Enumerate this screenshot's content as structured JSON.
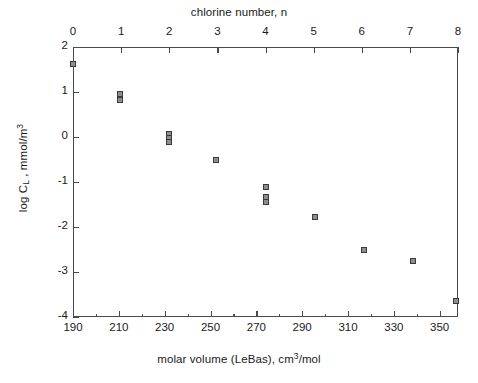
{
  "chart_data": {
    "type": "scatter",
    "title": "",
    "xlabel": "molar volume (LeBas), cm3/mol",
    "x2label": "chlorine number, n",
    "ylabel": "log CL , mmol/m3",
    "xlim": [
      190,
      358
    ],
    "x2lim": [
      0,
      8
    ],
    "ylim": [
      -4,
      2
    ],
    "grid": false,
    "legend": false,
    "xticks": [
      190,
      210,
      230,
      250,
      270,
      290,
      310,
      330,
      350
    ],
    "xticklabels": [
      "190",
      "210",
      "230",
      "250",
      "270",
      "290",
      "310",
      "330",
      "350"
    ],
    "xminorticks": [
      200,
      220,
      240,
      260,
      280,
      300,
      320,
      340
    ],
    "x2ticks": [
      0,
      1,
      2,
      3,
      4,
      5,
      6,
      7,
      8
    ],
    "x2ticklabels": [
      "0",
      "1",
      "2",
      "3",
      "4",
      "5",
      "6",
      "7",
      "8"
    ],
    "yticks": [
      2,
      1,
      0,
      -1,
      -2,
      -3,
      -4
    ],
    "yticklabels": [
      "2",
      "1",
      "0",
      "-1",
      "-2",
      "-3",
      "-4"
    ],
    "marker": "square",
    "marker_facecolor": "#8e8e8e",
    "marker_edgecolor": "#3a3a3a",
    "axis_color": "#4a4a4a",
    "points": [
      {
        "x": 190.0,
        "n": 0,
        "y": 1.63
      },
      {
        "x": 210.5,
        "n": 1,
        "y": 0.95
      },
      {
        "x": 210.5,
        "n": 1,
        "y": 0.83
      },
      {
        "x": 232.0,
        "n": 2,
        "y": 0.07
      },
      {
        "x": 232.0,
        "n": 2,
        "y": -0.02
      },
      {
        "x": 232.0,
        "n": 2,
        "y": -0.11
      },
      {
        "x": 252.5,
        "n": 3,
        "y": -0.5
      },
      {
        "x": 274.0,
        "n": 4,
        "y": -1.12
      },
      {
        "x": 274.0,
        "n": 4,
        "y": -1.34
      },
      {
        "x": 274.0,
        "n": 4,
        "y": -1.45
      },
      {
        "x": 295.5,
        "n": 5,
        "y": -1.78
      },
      {
        "x": 317.0,
        "n": 6,
        "y": -2.5
      },
      {
        "x": 338.5,
        "n": 7,
        "y": -2.76
      },
      {
        "x": 357.0,
        "n": 8,
        "y": -3.65
      }
    ]
  },
  "axes": {
    "top_title_text": "chlorine number, n",
    "bottom_title_prefix": "molar volume (LeBas), cm",
    "bottom_title_sup": "3",
    "bottom_title_suffix": "/mol",
    "left_title_prefix": "log C",
    "left_title_sub": "L",
    "left_title_mid": " , mmol/m",
    "left_title_sup": "3"
  }
}
